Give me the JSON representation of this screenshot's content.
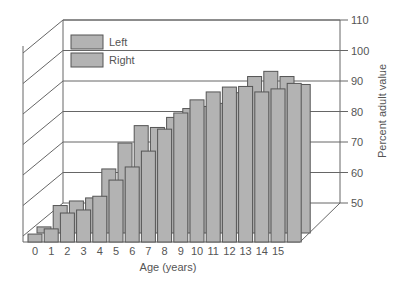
{
  "chart_data": {
    "type": "bar",
    "style": "3d-grouped",
    "title": "",
    "xlabel": "Age (years)",
    "ylabel": "Percent adult value",
    "categories": [
      "0",
      "1",
      "2",
      "3",
      "4",
      "5",
      "6",
      "7",
      "8",
      "9",
      "10",
      "11",
      "12",
      "13",
      "14",
      "15",
      ""
    ],
    "series": [
      {
        "name": "Left",
        "values": [
          52.6,
          54.3,
          59.5,
          60.5,
          65,
          70.3,
          74.6,
          79.8,
          87,
          92.3,
          96.6,
          99.2,
          100.8,
          101,
          99.2,
          100.2,
          102
        ]
      },
      {
        "name": "Right",
        "values": [
          52,
          59,
          60.5,
          61.5,
          71,
          79.5,
          85.2,
          84.6,
          87.9,
          90.8,
          91.5,
          92.5,
          96,
          101.3,
          103,
          101.3,
          98.7
        ]
      }
    ],
    "ylim": [
      50,
      110
    ],
    "yticks": [
      50,
      60,
      70,
      80,
      90,
      100,
      110
    ],
    "grid": true,
    "legend_position": "upper-left",
    "colors": {
      "bar_fill": "#b3b3b3",
      "bar_stroke": "#555555",
      "grid": "#666666",
      "text": "#555555"
    }
  },
  "legend": [
    {
      "label": "Left"
    },
    {
      "label": "Right"
    }
  ]
}
